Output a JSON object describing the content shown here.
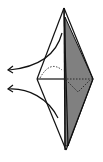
{
  "diagram": {
    "colors": {
      "background": "#ffffff",
      "line": "#111111",
      "shaded": "#808080"
    },
    "elements": [
      {
        "name": "kite-outline"
      },
      {
        "name": "shaded-flap"
      },
      {
        "name": "horizontal-crease"
      },
      {
        "name": "dotted-hidden-edges"
      },
      {
        "name": "arrow-upper"
      },
      {
        "name": "arrow-lower"
      }
    ]
  }
}
